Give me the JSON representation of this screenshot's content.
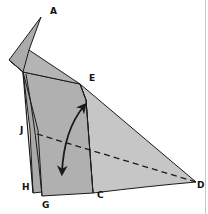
{
  "diagram": {
    "type": "origami-fold-step",
    "colors": {
      "paper_dark": "#a9a9a9",
      "paper_mid": "#b4b4b4",
      "paper_light": "#c6c6c6",
      "stroke": "#1a1a1a",
      "label": "#111111",
      "frame": "#c8c8c8"
    },
    "points": {
      "A": {
        "label": "A",
        "x": 41,
        "y": 17,
        "label_x": 50,
        "label_y": 14
      },
      "E": {
        "label": "E",
        "x": 80,
        "y": 84,
        "label_x": 89,
        "label_y": 81
      },
      "J": {
        "label": "J",
        "x": 30,
        "y": 130,
        "label_x": 20,
        "label_y": 133
      },
      "H": {
        "label": "H",
        "x": 33,
        "y": 193,
        "label_x": 22,
        "label_y": 190
      },
      "G": {
        "label": "G",
        "x": 42,
        "y": 196,
        "label_x": 42,
        "label_y": 208
      },
      "C": {
        "label": "C",
        "x": 93,
        "y": 193,
        "label_x": 97,
        "label_y": 198
      },
      "D": {
        "label": "D",
        "x": 196,
        "y": 182,
        "label_x": 197,
        "label_y": 188
      }
    },
    "fold_line": {
      "style": "dashed",
      "from": "J",
      "to": "D"
    },
    "arrow": {
      "style": "double-headed curved",
      "meaning": "fold flap E down to G and back"
    }
  }
}
